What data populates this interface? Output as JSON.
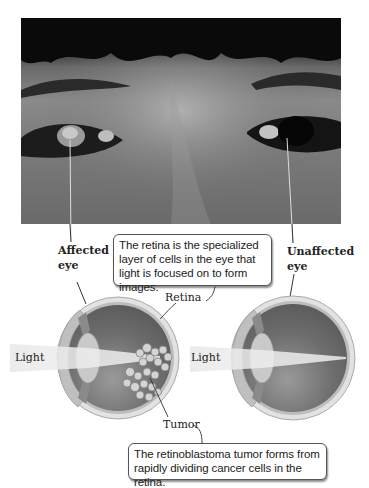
{
  "photo": {
    "description": "Close-up photo of child's eyes; left eye shows white pupil reflex (leukocoria)",
    "leader_targets": [
      "affected-eye-pupil",
      "unaffected-eye-pupil"
    ]
  },
  "labels": {
    "affected_eye_line1": "Affected",
    "affected_eye_line2": "eye",
    "unaffected_eye_line1": "Unaffected",
    "unaffected_eye_line2": "eye",
    "retina": "Retina",
    "tumor": "Tumor",
    "light_left": "Light",
    "light_right": "Light"
  },
  "callouts": {
    "retina_note": "The retina is the specialized layer of cells in the eye that light is focused on to form images.",
    "tumor_note": "The retinoblastoma tumor forms from rapidly dividing cancer cells in the retina."
  },
  "colors": {
    "eye_interior": "#6e6e6e",
    "sclera": "#d8d8d8",
    "tumor": "#c8c8c8",
    "light_beam": "#e6e6e6"
  }
}
